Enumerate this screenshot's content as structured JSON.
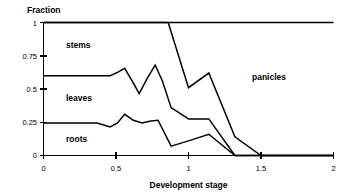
{
  "chart_data": {
    "type": "area",
    "title": "",
    "xlabel": "Development stage",
    "ylabel": "Fraction",
    "xlim": [
      0,
      2
    ],
    "ylim": [
      0,
      1
    ],
    "xticks": [
      0,
      0.5,
      1,
      1.5,
      2
    ],
    "xticklabels": [
      "0",
      "0.5",
      "1",
      "1.5",
      "2"
    ],
    "yticks": [
      0,
      0.25,
      0.5,
      0.75,
      1
    ],
    "yticklabels": [
      "0",
      "0.25",
      "0.5",
      "0.75",
      "1"
    ],
    "grid": false,
    "legend_position": "in-plot-annotations",
    "annotations": [
      {
        "text": "stems",
        "x": 0.26,
        "y": 0.82
      },
      {
        "text": "leaves",
        "x": 0.26,
        "y": 0.44
      },
      {
        "text": "roots",
        "x": 0.26,
        "y": 0.14
      },
      {
        "text": "panicles",
        "x": 1.52,
        "y": 0.62
      }
    ],
    "boundaries": [
      {
        "name": "roots-upper-boundary",
        "comment": "cumulative top of roots band (= roots fraction)",
        "points": [
          [
            0.0,
            0.245
          ],
          [
            0.37,
            0.245
          ],
          [
            0.46,
            0.215
          ],
          [
            0.51,
            0.245
          ],
          [
            0.56,
            0.31
          ],
          [
            0.62,
            0.265
          ],
          [
            0.68,
            0.245
          ],
          [
            0.74,
            0.26
          ],
          [
            0.79,
            0.265
          ],
          [
            0.88,
            0.07
          ],
          [
            1.0,
            0.11
          ],
          [
            1.14,
            0.16
          ],
          [
            1.32,
            0.0
          ],
          [
            1.5,
            0.0
          ],
          [
            2.0,
            0.0
          ]
        ]
      },
      {
        "name": "leaves-upper-boundary",
        "comment": "cumulative top of leaves band (= roots + leaves)",
        "points": [
          [
            0.0,
            0.6
          ],
          [
            0.46,
            0.6
          ],
          [
            0.51,
            0.625
          ],
          [
            0.56,
            0.655
          ],
          [
            0.62,
            0.545
          ],
          [
            0.66,
            0.465
          ],
          [
            0.72,
            0.59
          ],
          [
            0.77,
            0.68
          ],
          [
            0.82,
            0.56
          ],
          [
            0.88,
            0.36
          ],
          [
            1.0,
            0.275
          ],
          [
            1.14,
            0.275
          ],
          [
            1.32,
            0.0
          ],
          [
            1.5,
            0.0
          ],
          [
            2.0,
            0.0
          ]
        ]
      },
      {
        "name": "stems-upper-boundary",
        "comment": "cumulative top of stems band (= roots + leaves + stems)",
        "points": [
          [
            0.0,
            1.0
          ],
          [
            0.86,
            1.0
          ],
          [
            1.0,
            0.51
          ],
          [
            1.14,
            0.62
          ],
          [
            1.32,
            0.14
          ],
          [
            1.5,
            0.0
          ],
          [
            2.0,
            0.0
          ]
        ]
      },
      {
        "name": "total-unity-line",
        "comment": "the constant line at fraction = 1 (top of panicles band)",
        "points": [
          [
            0.0,
            1.0
          ],
          [
            2.0,
            1.0
          ]
        ]
      }
    ],
    "series": [
      {
        "name": "roots",
        "x": [
          0.0,
          0.37,
          0.46,
          0.51,
          0.56,
          0.62,
          0.68,
          0.74,
          0.79,
          0.88,
          1.0,
          1.14,
          1.32,
          1.5,
          2.0
        ],
        "values": [
          0.245,
          0.245,
          0.215,
          0.245,
          0.31,
          0.265,
          0.245,
          0.26,
          0.265,
          0.07,
          0.11,
          0.16,
          0.0,
          0.0,
          0.0
        ]
      },
      {
        "name": "leaves",
        "x": [
          0.0,
          0.46,
          0.56,
          0.66,
          0.77,
          0.88,
          1.0,
          1.14,
          1.32,
          1.5,
          2.0
        ],
        "values": [
          0.355,
          0.385,
          0.345,
          0.25,
          0.415,
          0.29,
          0.165,
          0.115,
          0.0,
          0.0,
          0.0
        ]
      },
      {
        "name": "stems",
        "x": [
          0.0,
          0.56,
          0.77,
          0.86,
          1.0,
          1.14,
          1.32,
          1.5,
          2.0
        ],
        "values": [
          0.4,
          0.345,
          0.32,
          0.64,
          0.235,
          0.345,
          0.14,
          0.0,
          0.0
        ]
      },
      {
        "name": "panicles",
        "x": [
          0.0,
          0.86,
          1.0,
          1.14,
          1.32,
          1.5,
          2.0
        ],
        "values": [
          0.0,
          0.0,
          0.49,
          0.38,
          0.86,
          1.0,
          1.0
        ]
      }
    ],
    "colors": {
      "line": "#000000",
      "axis": "#000000",
      "background": "#ffffff",
      "text": "#000000"
    }
  },
  "labels": {
    "y_axis_title": "Fraction",
    "x_axis_title": "Development stage",
    "region_stems": "stems",
    "region_leaves": "leaves",
    "region_roots": "roots",
    "region_panicles": "panicles",
    "ytick_0": "0",
    "ytick_025": "0.25",
    "ytick_05": "0.5",
    "ytick_075": "0.75",
    "ytick_1": "1",
    "xtick_0": "0",
    "xtick_05": "0.5",
    "xtick_1": "1",
    "xtick_15": "1.5",
    "xtick_2": "2"
  }
}
